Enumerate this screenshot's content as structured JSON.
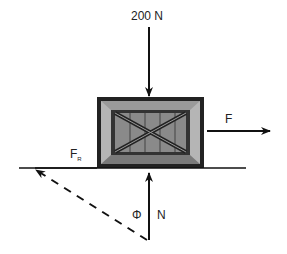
{
  "diagram": {
    "forces": {
      "applied_top": {
        "label": "200 N",
        "direction": "down"
      },
      "pull": {
        "label": "F",
        "direction": "right"
      },
      "friction": {
        "label": "F",
        "subscript": "R",
        "direction": "left"
      },
      "normal": {
        "label": "N",
        "direction": "up"
      },
      "angle": {
        "label": "Φ"
      }
    },
    "colors": {
      "stroke": "#111111",
      "box_dark": "#222222",
      "box_mid": "#8a8a8a",
      "box_light": "#b5b5b5"
    }
  }
}
